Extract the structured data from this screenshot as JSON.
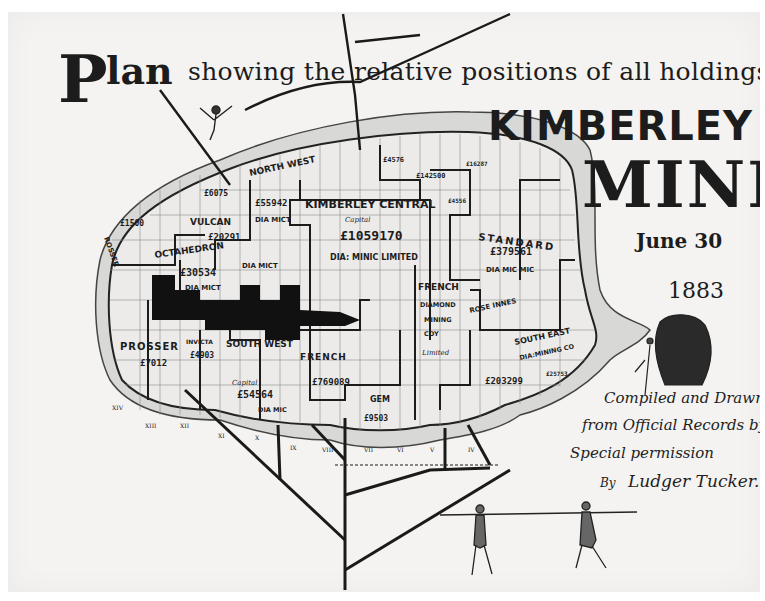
{
  "title": {
    "initial": "P",
    "word_plan": "lan",
    "line1": "showing the relative positions of all holdings in",
    "place": "KIMBERLEY",
    "mine": "MINE",
    "date": "June 30",
    "year": "1883"
  },
  "credits": {
    "line1": "Compiled and Drawn",
    "line2": "from Official Records by",
    "line3": "Special permission",
    "line4_by": "By",
    "line4_name": "Ludger Tucker."
  },
  "holdings": [
    {
      "name": "KIMBERLEY CENTRAL",
      "sub": "Capital",
      "capital": "£1059170",
      "suffix": "DIA: MINIC LIMITED"
    },
    {
      "name": "NORTH WEST",
      "capital": "£55942",
      "suffix": "DIA MICT"
    },
    {
      "name": "VULCAN",
      "capital": "£20291",
      "suffix": "DIA MICT"
    },
    {
      "name": "OCTAHEDRON",
      "capital": "£30534",
      "suffix": "DIA MICT"
    },
    {
      "name": "STANDARD",
      "capital": "£379561",
      "suffix": "DIA MIC MIC"
    },
    {
      "name": "FRENCH DIAMOND MINING COY",
      "suffix": "Limited"
    },
    {
      "name": "ROSE INNES"
    },
    {
      "name": "SOUTH EAST DIA: MINING CO",
      "capital": "£203299"
    },
    {
      "name": "PROSSER",
      "capital": "£7012"
    },
    {
      "name": "INVICTA",
      "capital": "£4903"
    },
    {
      "name": "SOUTH WEST",
      "sub": "Capital",
      "capital": "£54564",
      "suffix": "DIA MIC"
    },
    {
      "name": "FRENCH",
      "sub": "Capital",
      "capital": "£769089"
    },
    {
      "name": "GEM",
      "capital": "£9503",
      "suffix": "Limited"
    },
    {
      "name": "ROSSER"
    },
    {
      "capital": "£6075"
    },
    {
      "capital": "£1500"
    },
    {
      "capital": "£4576"
    },
    {
      "capital": "£142500",
      "suffix": "British Dia"
    },
    {
      "capital": "£16287",
      "suffix": "Metrop"
    },
    {
      "capital": "£4556"
    },
    {
      "capital": "£25753"
    }
  ],
  "roads": [
    "XIV",
    "XIII",
    "XII",
    "XI",
    "X",
    "IX",
    "VIII",
    "VII",
    "VI",
    "V",
    "IV"
  ],
  "colors": {
    "paper": "#f4f3f1",
    "ink": "#1c1c1c",
    "reef": "#d6d6d4",
    "claims": "#ecebea"
  }
}
